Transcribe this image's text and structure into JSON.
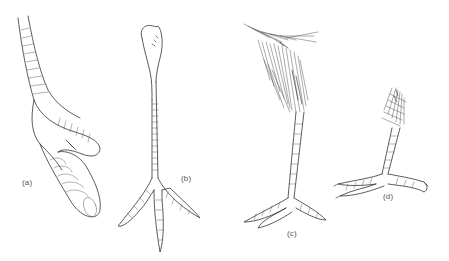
{
  "figure": {
    "panels": [
      {
        "id": "a",
        "label": "(a)",
        "subject": "foot with scaled toes, curved tarsus"
      },
      {
        "id": "b",
        "label": "(b)",
        "subject": "scaled tarsus with three spread toes"
      },
      {
        "id": "c",
        "label": "(c)",
        "subject": "long leg with feathered thigh, slender tarsus"
      },
      {
        "id": "d",
        "label": "(d)",
        "subject": "short leg with feathered thigh, clawed toes"
      }
    ],
    "colors": {
      "background": "#ffffff",
      "ink": "#333333",
      "label": "#555555"
    }
  }
}
